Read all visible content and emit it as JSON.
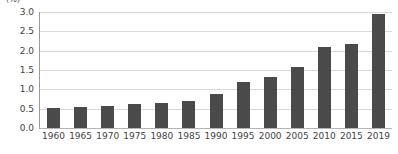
{
  "chart_data": {
    "type": "bar",
    "title": "",
    "unit_label": "(%)",
    "xlabel": "",
    "ylabel": "",
    "categories": [
      "1960",
      "1965",
      "1970",
      "1975",
      "1980",
      "1985",
      "1990",
      "1995",
      "2000",
      "2005",
      "2010",
      "2015",
      "2019"
    ],
    "values": [
      0.53,
      0.55,
      0.58,
      0.61,
      0.64,
      0.69,
      0.87,
      1.18,
      1.32,
      1.57,
      2.1,
      2.17,
      2.95
    ],
    "ylim": [
      0.0,
      3.0
    ],
    "ytick_values": [
      0.0,
      0.5,
      1.0,
      1.5,
      2.0,
      2.5,
      3.0
    ],
    "ytick_labels": [
      "0.0",
      "0.5",
      "1.0",
      "1.5",
      "2.0",
      "2.5",
      "3.0"
    ],
    "grid": true,
    "legend": false,
    "bar_color": "#4a4a4a",
    "gridline_color": "#d9d9d9",
    "axis_color": "#9a9a9a",
    "background_color": "#ffffff"
  }
}
